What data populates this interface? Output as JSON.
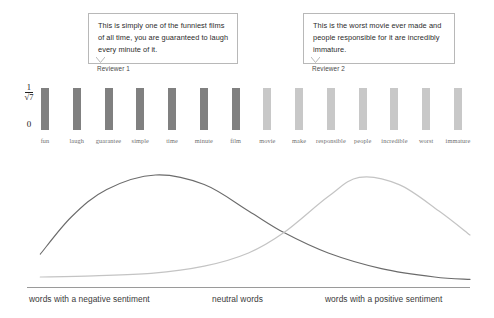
{
  "callouts": [
    {
      "text": "This is simply one of the funniest films of all time, you are guaranteed to laugh every minute of it.",
      "author": "Reviewer 1"
    },
    {
      "text": "This is the worst movie ever made and people responsible for it are incredibly immature.",
      "author": "Reviewer 2"
    }
  ],
  "axis": {
    "top_numerator": "1",
    "top_denominator": "√7",
    "zero": "0"
  },
  "footer": {
    "negative": "words with a negative sentiment",
    "neutral": "neutral words",
    "positive": "words with a positive sentiment"
  },
  "colors": {
    "bar_negative": "#808080",
    "bar_positive": "#c8c8c8",
    "curve_negative": "#6b6b6b",
    "curve_positive": "#c4c4c4",
    "box_border": "#b8b8b8"
  },
  "chart_data": {
    "type": "bar",
    "title": "",
    "xlabel": "",
    "ylabel": "",
    "ylim": [
      0,
      1
    ],
    "ytick_labels": [
      "0",
      "1/√7"
    ],
    "ytick_values": [
      0,
      0.3779
    ],
    "grid": false,
    "legend": null,
    "categories": [
      "fun",
      "laugh",
      "guarantee",
      "simple",
      "time",
      "minute",
      "film",
      "movie",
      "make",
      "responsible",
      "people",
      "incredible",
      "worst",
      "immature"
    ],
    "values": [
      0.3779,
      0.3779,
      0.3779,
      0.3779,
      0.3779,
      0.3779,
      0.3779,
      0.3779,
      0.3779,
      0.3779,
      0.3779,
      0.3779,
      0.3779,
      0.3779
    ],
    "bar_groups": [
      {
        "name": "negative sentiment words",
        "indices": [
          0,
          1,
          2,
          3,
          4,
          5,
          6
        ],
        "color": "#808080"
      },
      {
        "name": "positive sentiment words",
        "indices": [
          7,
          8,
          9,
          10,
          11,
          12,
          13
        ],
        "color": "#c8c8c8"
      }
    ]
  },
  "curve_data": {
    "type": "line",
    "title": "",
    "xlabel": "sentiment axis",
    "ylabel": "density",
    "grid": false,
    "series": [
      {
        "name": "negative sentiment distribution",
        "color": "#6b6b6b",
        "peak_x": 0.29,
        "points": [
          [
            0.03,
            0.24
          ],
          [
            0.1,
            0.55
          ],
          [
            0.18,
            0.78
          ],
          [
            0.29,
            0.9
          ],
          [
            0.4,
            0.82
          ],
          [
            0.5,
            0.6
          ],
          [
            0.58,
            0.42
          ],
          [
            0.68,
            0.25
          ],
          [
            0.8,
            0.12
          ],
          [
            0.92,
            0.05
          ],
          [
            1.0,
            0.03
          ]
        ]
      },
      {
        "name": "positive sentiment distribution",
        "color": "#c4c4c4",
        "peak_x": 0.75,
        "points": [
          [
            0.03,
            0.05
          ],
          [
            0.15,
            0.06
          ],
          [
            0.28,
            0.08
          ],
          [
            0.4,
            0.14
          ],
          [
            0.5,
            0.25
          ],
          [
            0.58,
            0.42
          ],
          [
            0.68,
            0.72
          ],
          [
            0.75,
            0.88
          ],
          [
            0.84,
            0.82
          ],
          [
            0.93,
            0.6
          ],
          [
            1.0,
            0.4
          ]
        ]
      }
    ],
    "crossing_point_x": 0.58
  }
}
